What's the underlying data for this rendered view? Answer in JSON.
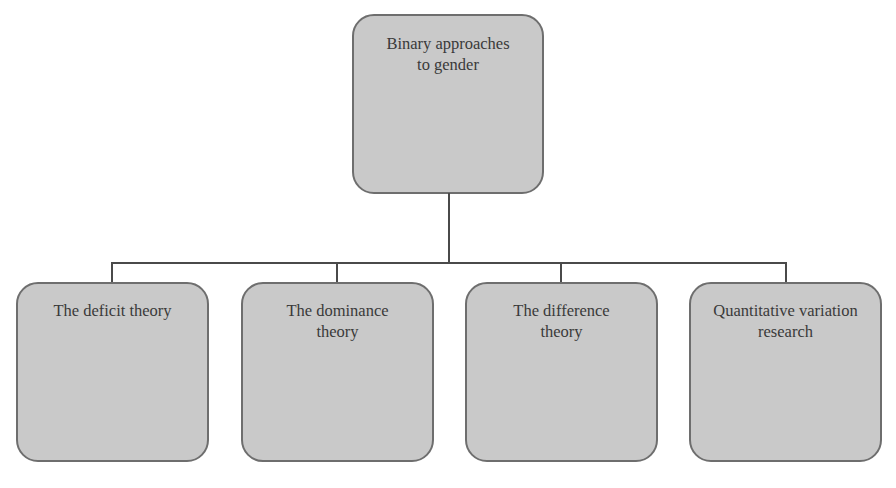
{
  "diagram": {
    "type": "hierarchy",
    "root": {
      "label": "Binary approaches to gender"
    },
    "children": [
      {
        "label": "The deficit theory"
      },
      {
        "label": "The dominance theory"
      },
      {
        "label": "The difference theory"
      },
      {
        "label": "Quantitative variation research"
      }
    ],
    "colors": {
      "box_fill": "#c9c9c9",
      "box_border": "#6e6e6e",
      "connector": "#4a4a4a",
      "text": "#3a3a3a"
    }
  }
}
